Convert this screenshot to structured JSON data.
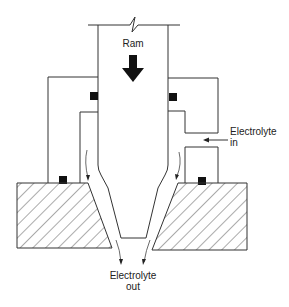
{
  "diagram": {
    "labels": {
      "ram": "Ram",
      "electrolyte_in_line1": "Electrolyte",
      "electrolyte_in_line2": "in",
      "electrolyte_out_line1": "Electrolyte",
      "electrolyte_out_line2": "out"
    },
    "components": [
      {
        "name": "ram",
        "description": "Vertical ram / tool with break line at top"
      },
      {
        "name": "feed-arrow",
        "description": "Bold downward arrow showing ram feed direction"
      },
      {
        "name": "left-housing",
        "description": "Left electrolyte housing"
      },
      {
        "name": "right-housing",
        "description": "Right electrolyte housing with inlet port"
      },
      {
        "name": "seals",
        "description": "Four black square seals"
      },
      {
        "name": "workpiece-left",
        "description": "Left hatched workpiece block"
      },
      {
        "name": "workpiece-right",
        "description": "Right hatched workpiece block"
      },
      {
        "name": "electrolyte-flow",
        "description": "Flow arrows through the tapered gap"
      }
    ],
    "colors": {
      "line": "#333333",
      "seal": "#111111",
      "background": "#ffffff"
    }
  }
}
